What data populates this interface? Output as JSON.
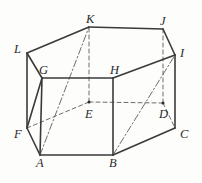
{
  "figure": {
    "canvas": {
      "width": 202,
      "height": 183
    },
    "colors": {
      "background": "#fdfdfc",
      "stroke_solid": "#3a3a3a",
      "stroke_hidden": "#6d6d6d",
      "stroke_diagonal": "#6d6d6d",
      "label_text": "#2b2b2b",
      "vertex_dot": "#2b2b2b"
    },
    "stroke_widths": {
      "solid": 1.6,
      "hidden": 1.0,
      "diagonal": 1.0
    },
    "dash_patterns": {
      "hidden": "4,3",
      "diagonal": "7,2.5,1.5,2.5"
    },
    "vertices": [
      {
        "name": "A",
        "x": 40,
        "y": 155,
        "label_dx": -4,
        "label_dy": 12,
        "dot": false
      },
      {
        "name": "B",
        "x": 113,
        "y": 155,
        "label_dx": -4,
        "label_dy": 12,
        "dot": false
      },
      {
        "name": "C",
        "x": 175,
        "y": 128,
        "label_dx": 5,
        "label_dy": 10,
        "dot": false
      },
      {
        "name": "D",
        "x": 163,
        "y": 103,
        "label_dx": -4,
        "label_dy": 15,
        "dot": true
      },
      {
        "name": "E",
        "x": 89,
        "y": 102,
        "label_dx": -4,
        "label_dy": 16,
        "dot": true
      },
      {
        "name": "F",
        "x": 27,
        "y": 128,
        "label_dx": -13,
        "label_dy": 10,
        "dot": false
      },
      {
        "name": "G",
        "x": 42,
        "y": 78,
        "label_dx": -3,
        "label_dy": -4,
        "dot": false
      },
      {
        "name": "H",
        "x": 113,
        "y": 78,
        "label_dx": -3,
        "label_dy": -4,
        "dot": false
      },
      {
        "name": "I",
        "x": 175,
        "y": 55,
        "label_dx": 5,
        "label_dy": 2,
        "dot": false
      },
      {
        "name": "J",
        "x": 163,
        "y": 29,
        "label_dx": -3,
        "label_dy": -4,
        "dot": false
      },
      {
        "name": "K",
        "x": 89,
        "y": 27,
        "label_dx": -3,
        "label_dy": -4,
        "dot": false
      },
      {
        "name": "L",
        "x": 27,
        "y": 53,
        "label_dx": -13,
        "label_dy": 0,
        "dot": false
      }
    ],
    "edges_solid": [
      {
        "from": "A",
        "to": "B",
        "name": "edge-a-b"
      },
      {
        "from": "B",
        "to": "C",
        "name": "edge-b-c"
      },
      {
        "from": "A",
        "to": "F",
        "name": "edge-a-f"
      },
      {
        "from": "F",
        "to": "G",
        "name": "edge-f-g"
      },
      {
        "from": "G",
        "to": "H",
        "name": "edge-g-h"
      },
      {
        "from": "H",
        "to": "I",
        "name": "edge-h-i"
      },
      {
        "from": "I",
        "to": "J",
        "name": "edge-i-j"
      },
      {
        "from": "J",
        "to": "K",
        "name": "edge-j-k"
      },
      {
        "from": "K",
        "to": "L",
        "name": "edge-k-l"
      },
      {
        "from": "L",
        "to": "G",
        "name": "edge-l-g"
      },
      {
        "from": "F",
        "to": "L",
        "name": "edge-f-l"
      },
      {
        "from": "B",
        "to": "H",
        "name": "edge-b-h"
      },
      {
        "from": "C",
        "to": "I",
        "name": "edge-c-i"
      },
      {
        "from": "A",
        "to": "G",
        "name": "edge-a-g"
      }
    ],
    "edges_hidden": [
      {
        "from": "F",
        "to": "E",
        "name": "edge-f-e"
      },
      {
        "from": "E",
        "to": "D",
        "name": "edge-e-d"
      },
      {
        "from": "D",
        "to": "C",
        "name": "edge-d-c"
      },
      {
        "from": "E",
        "to": "K",
        "name": "edge-e-k"
      },
      {
        "from": "D",
        "to": "J",
        "name": "edge-d-j"
      }
    ],
    "edges_diagonal": [
      {
        "from": "A",
        "to": "K",
        "name": "diagonal-a-k"
      },
      {
        "from": "B",
        "to": "I",
        "name": "diagonal-b-i"
      }
    ]
  }
}
